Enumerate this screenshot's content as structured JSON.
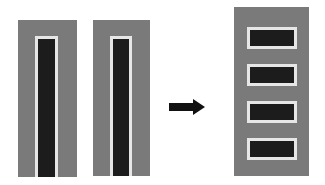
{
  "diagram": {
    "colors": {
      "panel": "#7a7a7a",
      "bar": "#1c1c1c",
      "border": "#e6e6e6",
      "arrow": "#111111"
    },
    "left_panels": [
      {
        "bars": 1,
        "orientation": "vertical"
      },
      {
        "bars": 1,
        "orientation": "vertical"
      }
    ],
    "arrow": "right-arrow",
    "right_panel": {
      "bars": 4,
      "orientation": "horizontal"
    }
  }
}
